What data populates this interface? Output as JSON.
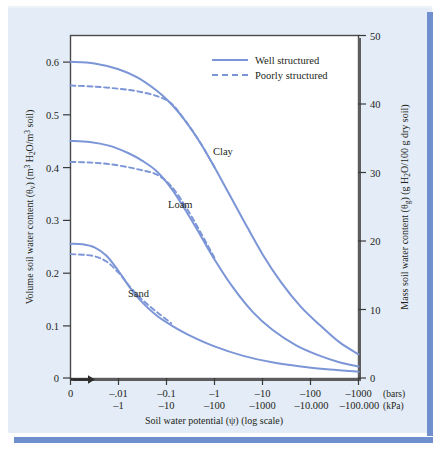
{
  "figure": {
    "background_color": "#e3ecf7",
    "border_color": "#6f8fcf",
    "curve_color": "#7b95d6",
    "axis_color": "#3a3a3a",
    "text_color": "#231f20"
  },
  "legend": {
    "position": "top-right",
    "items": [
      {
        "label": "Well structured",
        "style": "solid"
      },
      {
        "label": "Poorly structured",
        "style": "dashed"
      }
    ]
  },
  "axes": {
    "left": {
      "title_main": "Volume soil water content (",
      "title_symbol": "θ",
      "title_symbol_sub": "v",
      "title_mid": ") (m",
      "title_sup1": "3",
      "title_h2o": " H",
      "title_sub2": "2",
      "title_o": "O/m",
      "title_sup2": "3",
      "title_end": " soil)",
      "ticks": [
        "0.6",
        "0.5",
        "0.4",
        "0.3",
        "0.2",
        "0.1",
        "0"
      ],
      "tick_values": [
        0.6,
        0.5,
        0.4,
        0.3,
        0.2,
        0.1,
        0
      ],
      "range": [
        0,
        0.65
      ]
    },
    "right": {
      "title_main": "Mass soil water content (",
      "title_symbol": "θ",
      "title_symbol_sub": "g",
      "title_mid": ") (g H",
      "title_sub2": "2",
      "title_end": "O/100 g dry soil)",
      "ticks": [
        "50",
        "40",
        "30",
        "20",
        "10",
        "0"
      ],
      "tick_values": [
        50,
        40,
        30,
        20,
        10,
        0
      ],
      "range": [
        0,
        50
      ]
    },
    "bottom": {
      "title_main": "Soil water potential (",
      "title_symbol": "ψ",
      "title_end": ") (log scale)",
      "bars_unit": "(bars)",
      "kpa_unit": "(kPa)",
      "bars_ticks": [
        "0",
        "–.01",
        "–0.1",
        "–1",
        "–10",
        "–100",
        "–1000"
      ],
      "kpa_ticks": [
        "",
        "–1",
        "–10",
        "–100",
        "–1000",
        "–10.000",
        "–100.000"
      ],
      "origin_arrow": true
    }
  },
  "chart_data": {
    "type": "line",
    "title": "",
    "xlabel": "Soil water potential (ψ) (log scale)",
    "ylabel": "Volume soil water content (θv) (m3 H2O/m3 soil)",
    "ylabel_right": "Mass soil water content (θg) (g H2O/100 g dry soil)",
    "x_scale": "log",
    "x_tick_labels_bars": [
      "0",
      "-.01",
      "-0.1",
      "-1",
      "-10",
      "-100",
      "-1000"
    ],
    "x_tick_labels_kpa": [
      "",
      "-1",
      "-10",
      "-100",
      "-1000",
      "-10.000",
      "-100.000"
    ],
    "x_tick_positions": [
      0,
      1,
      2,
      3,
      4,
      5,
      6
    ],
    "ylim": [
      0,
      0.65
    ],
    "ylim_right": [
      0,
      50
    ],
    "grid": false,
    "legend_position": "upper right",
    "series": [
      {
        "name": "Clay — Well structured",
        "soil": "Clay",
        "structure": "Well structured",
        "style": "solid",
        "x": [
          0,
          0.5,
          1.0,
          1.4,
          1.8,
          2.1,
          2.4,
          2.7,
          3.0,
          3.3,
          3.6,
          4.0,
          4.4,
          4.8,
          5.2,
          5.6,
          6.0
        ],
        "y": [
          0.6,
          0.597,
          0.586,
          0.57,
          0.545,
          0.52,
          0.487,
          0.447,
          0.4,
          0.35,
          0.3,
          0.235,
          0.18,
          0.135,
          0.1,
          0.068,
          0.045
        ]
      },
      {
        "name": "Clay — Poorly structured",
        "soil": "Clay",
        "structure": "Poorly structured",
        "style": "dashed",
        "x": [
          0,
          0.5,
          1.0,
          1.4,
          1.8,
          2.1,
          2.4,
          2.7,
          3.0
        ],
        "y": [
          0.555,
          0.553,
          0.549,
          0.544,
          0.535,
          0.521,
          0.487,
          0.447,
          0.4
        ]
      },
      {
        "name": "Loam — Well structured",
        "soil": "Loam",
        "structure": "Well structured",
        "style": "solid",
        "x": [
          0,
          0.4,
          0.8,
          1.2,
          1.5,
          1.8,
          2.1,
          2.4,
          2.7,
          3.0,
          3.4,
          3.8,
          4.2,
          4.7,
          5.2,
          5.6,
          6.0
        ],
        "y": [
          0.45,
          0.448,
          0.441,
          0.427,
          0.412,
          0.392,
          0.36,
          0.318,
          0.272,
          0.225,
          0.17,
          0.125,
          0.092,
          0.062,
          0.042,
          0.03,
          0.022
        ]
      },
      {
        "name": "Loam — Poorly structured",
        "soil": "Loam",
        "structure": "Poorly structured",
        "style": "dashed",
        "x": [
          0,
          0.4,
          0.8,
          1.2,
          1.5,
          1.8,
          2.1,
          2.4,
          2.7,
          3.0
        ],
        "y": [
          0.41,
          0.409,
          0.406,
          0.4,
          0.394,
          0.386,
          0.364,
          0.325,
          0.278,
          0.228
        ]
      },
      {
        "name": "Sand — Well structured",
        "soil": "Sand",
        "structure": "Well structured",
        "style": "solid",
        "x": [
          0,
          0.25,
          0.5,
          0.75,
          1.0,
          1.25,
          1.5,
          1.8,
          2.1,
          2.5,
          3.0,
          3.6,
          4.2,
          4.8,
          5.4,
          6.0
        ],
        "y": [
          0.255,
          0.254,
          0.248,
          0.232,
          0.203,
          0.17,
          0.143,
          0.118,
          0.1,
          0.08,
          0.06,
          0.042,
          0.03,
          0.022,
          0.016,
          0.012
        ]
      },
      {
        "name": "Sand — Poorly structured",
        "soil": "Sand",
        "structure": "Poorly structured",
        "style": "dashed",
        "x": [
          0,
          0.25,
          0.5,
          0.75,
          1.0,
          1.25,
          1.5,
          1.8,
          2.1
        ],
        "y": [
          0.235,
          0.234,
          0.231,
          0.221,
          0.2,
          0.172,
          0.148,
          0.125,
          0.104
        ]
      }
    ],
    "annotations": [
      {
        "text": "Clay",
        "x": 2.95,
        "y": 0.465
      },
      {
        "text": "Loam",
        "x": 2.2,
        "y": 0.315
      },
      {
        "text": "Sand",
        "x": 1.6,
        "y": 0.168
      }
    ]
  },
  "curve_labels": {
    "clay": "Clay",
    "loam": "Loam",
    "sand": "Sand"
  }
}
